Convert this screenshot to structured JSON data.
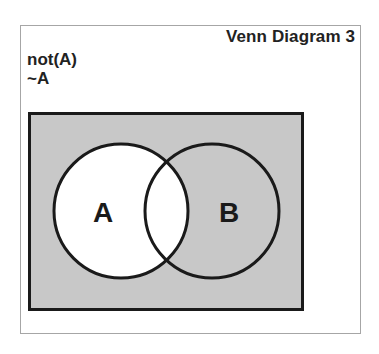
{
  "title": "Venn Diagram 3",
  "expression": {
    "line1": "not(A)",
    "line2": "~A"
  },
  "diagram": {
    "universe_fill": "#c8c8c8",
    "shaded_region": "complement of A",
    "set_a_fill": "#ffffff",
    "outline_color": "#1a1a1a",
    "sets": [
      {
        "label": "A"
      },
      {
        "label": "B"
      }
    ]
  }
}
